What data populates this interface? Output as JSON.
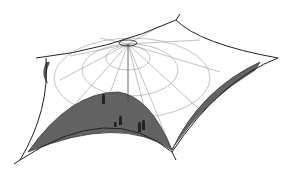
{
  "figure": {
    "background": "#ffffff",
    "line_color": "#333333",
    "grid_color": "#888888",
    "shade_color": "#555555",
    "figures_count": 5
  }
}
